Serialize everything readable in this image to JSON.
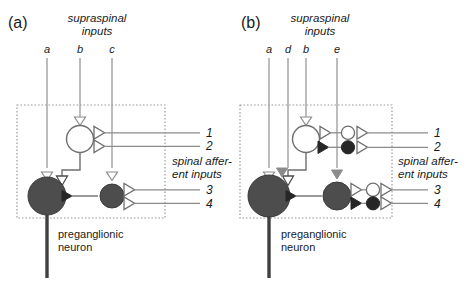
{
  "figure": {
    "panels": [
      {
        "id": "a",
        "label": "(a)",
        "supraspinal_title_line1": "supraspinal",
        "supraspinal_title_line2": "inputs",
        "supraspinal_inputs": [
          "a",
          "b",
          "c"
        ],
        "afferent_title_line1": "spinal affer-",
        "afferent_title_line2": "ent inputs",
        "afferent_inputs": [
          "1",
          "2",
          "3",
          "4"
        ],
        "output_label_line1": "preganglionic",
        "output_label_line2": "neuron",
        "neurons": [
          {
            "name": "interneuron-open",
            "fill": "open"
          },
          {
            "name": "preganglionic-soma",
            "fill": "filled"
          },
          {
            "name": "interneuron-filled",
            "fill": "filled"
          }
        ]
      },
      {
        "id": "b",
        "label": "(b)",
        "supraspinal_title_line1": "supraspinal",
        "supraspinal_title_line2": "inputs",
        "supraspinal_inputs": [
          "a",
          "d",
          "b",
          "e"
        ],
        "afferent_title_line1": "spinal affer-",
        "afferent_title_line2": "ent inputs",
        "afferent_inputs": [
          "1",
          "2",
          "3",
          "4"
        ],
        "output_label_line1": "preganglionic",
        "output_label_line2": "neuron",
        "neurons": [
          {
            "name": "interneuron-open",
            "fill": "open"
          },
          {
            "name": "preganglionic-soma",
            "fill": "filled"
          },
          {
            "name": "interneuron-filled",
            "fill": "filled"
          },
          {
            "name": "small-circle-open-1",
            "fill": "open"
          },
          {
            "name": "small-circle-filled-2",
            "fill": "filled"
          },
          {
            "name": "small-circle-open-3",
            "fill": "open"
          },
          {
            "name": "small-circle-filled-4",
            "fill": "filled"
          }
        ]
      }
    ],
    "colors": {
      "soma_fill": "#4d4d4d",
      "line": "#8c8c8c",
      "dark_line": "#4d4d4d",
      "text": "#1a1a1a",
      "excitatory_open": "#ffffff",
      "inhibitory_filled": "#262626",
      "gray_terminal": "#808080",
      "dotted_box": "#9a9a9a"
    }
  }
}
